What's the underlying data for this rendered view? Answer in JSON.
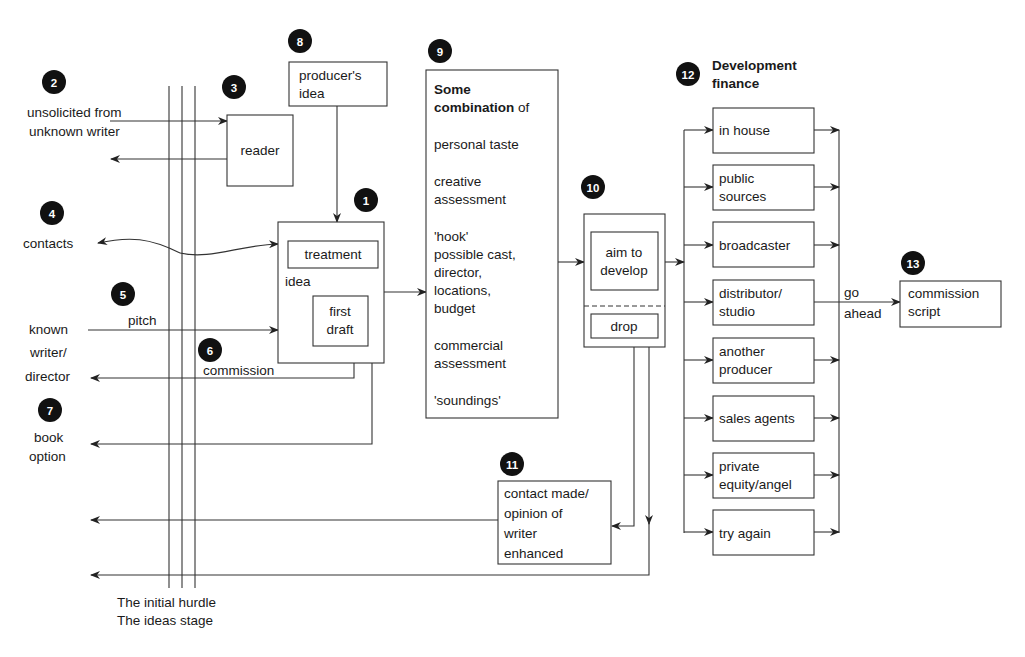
{
  "diagram": {
    "markers": {
      "m1": "1",
      "m2": "2",
      "m3": "3",
      "m4": "4",
      "m5": "5",
      "m6": "6",
      "m7": "7",
      "m8": "8",
      "m9": "9",
      "m10": "10",
      "m11": "11",
      "m12": "12",
      "m13": "13"
    },
    "sources": {
      "unsolicited_line1": "unsolicited from",
      "unsolicited_line2": "unknown writer",
      "contacts": "contacts",
      "known_line1": "known",
      "known_line2": "writer/",
      "known_line3": "director",
      "book_line1": "book",
      "book_line2": "option",
      "pitch": "pitch",
      "commission": "commission"
    },
    "reader": {
      "label": "reader"
    },
    "producers_idea": {
      "line1": "producer's",
      "line2": "idea"
    },
    "idea_box": {
      "label": "idea",
      "treatment": "treatment",
      "first_draft_line1": "first",
      "first_draft_line2": "draft"
    },
    "combination_box": {
      "heading_line1": "Some",
      "heading_line2_bold": "combination",
      "heading_line2_rest": " of",
      "items": [
        [
          "personal taste"
        ],
        [
          "creative",
          "assessment"
        ],
        [
          "'hook'",
          "possible cast,",
          "director,",
          "locations,",
          "budget"
        ],
        [
          "commercial",
          "assessment"
        ],
        [
          "'soundings'"
        ]
      ]
    },
    "decision_box": {
      "aim_line1": "aim to",
      "aim_line2": "develop",
      "drop": "drop"
    },
    "contact_box": {
      "lines": [
        "contact made/",
        "opinion of",
        "writer",
        "enhanced"
      ]
    },
    "finance": {
      "title_line1": "Development",
      "title_line2": "finance",
      "options": [
        [
          "in house"
        ],
        [
          "public",
          "sources"
        ],
        [
          "broadcaster"
        ],
        [
          "distributor/",
          "studio"
        ],
        [
          "another",
          "producer"
        ],
        [
          "sales agents"
        ],
        [
          "private",
          "equity/angel"
        ],
        [
          "try again"
        ]
      ]
    },
    "go_ahead": {
      "line1": "go",
      "line2": "ahead"
    },
    "commission_script": {
      "line1": "commission",
      "line2": "script"
    },
    "hurdle": {
      "line1": "The initial hurdle",
      "line2": "The ideas stage"
    }
  }
}
